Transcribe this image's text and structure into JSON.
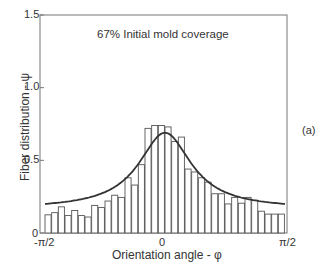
{
  "chart_data": {
    "type": "bar",
    "title": "67% Initial mold coverage",
    "panel_label": "(a)",
    "xlabel": "Orientation angle - φ",
    "ylabel": "Fiber distribution - ψ",
    "xlim": [
      "-π/2",
      "π/2"
    ],
    "ylim": [
      0,
      1.5
    ],
    "x_ticks": [
      "-π/2",
      "0",
      "π/2"
    ],
    "y_ticks": [
      "0",
      "0.5",
      "1.0",
      "1.5"
    ],
    "grid": false,
    "n_bins": 36,
    "values": [
      0.125,
      0.14,
      0.18,
      0.12,
      0.155,
      0.12,
      0.11,
      0.19,
      0.175,
      0.22,
      0.26,
      0.245,
      0.38,
      0.33,
      0.47,
      0.72,
      0.74,
      0.74,
      0.73,
      0.63,
      0.66,
      0.44,
      0.42,
      0.38,
      0.35,
      0.27,
      0.27,
      0.2,
      0.245,
      0.205,
      0.245,
      0.225,
      0.15,
      0.13,
      0.13,
      0.13
    ],
    "series": [
      {
        "name": "Measured histogram",
        "type": "bar"
      },
      {
        "name": "Fitted distribution",
        "type": "line",
        "peak": 0.69,
        "baseline": 0.165
      }
    ]
  }
}
